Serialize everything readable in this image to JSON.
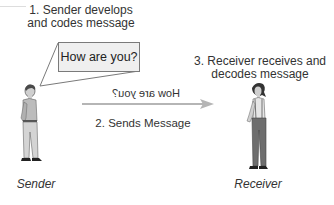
{
  "diagram": {
    "steps": [
      {
        "number": "1",
        "lines": [
          "1. Sender develops",
          "and codes message"
        ]
      },
      {
        "number": "2",
        "label": "2. Sends Message"
      },
      {
        "number": "3",
        "lines": [
          "3. Receiver receives and",
          "decodes message"
        ]
      }
    ],
    "speech_bubble_text": "How are you?",
    "transmitted_message_mirrored": "How are you?",
    "actors": {
      "sender": {
        "label": "Sender",
        "icon": "man-standing-figure"
      },
      "receiver": {
        "label": "Receiver",
        "icon": "woman-standing-figure"
      }
    },
    "arrow": {
      "direction": "left-to-right",
      "color": "#b5b5b5",
      "icon": "arrow-right-icon"
    },
    "colors": {
      "text": "#333333",
      "bubble_fill": "#efefef",
      "bubble_border": "#7a7a7a",
      "arrow": "#b5b5b5",
      "figure_shirt": "#b9b9b9",
      "figure_pants": "#6e6e6e"
    }
  }
}
